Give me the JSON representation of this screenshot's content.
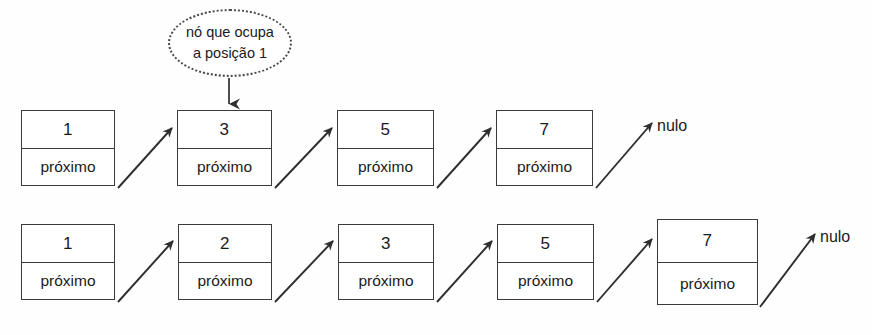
{
  "diagram": {
    "callout": {
      "line1": "nó que ocupa",
      "line2": "a posição 1"
    },
    "null_label": "nulo",
    "link_label": "próximo",
    "rows": [
      {
        "name": "lista-original",
        "nodes": [
          {
            "value": "1",
            "link": "próximo"
          },
          {
            "value": "3",
            "link": "próximo"
          },
          {
            "value": "5",
            "link": "próximo"
          },
          {
            "value": "7",
            "link": "próximo"
          }
        ],
        "terminator": "nulo"
      },
      {
        "name": "lista-apos-insercao",
        "nodes": [
          {
            "value": "1",
            "link": "próximo"
          },
          {
            "value": "2",
            "link": "próximo"
          },
          {
            "value": "3",
            "link": "próximo"
          },
          {
            "value": "5",
            "link": "próximo"
          },
          {
            "value": "7",
            "link": "próximo"
          }
        ],
        "terminator": "nulo"
      }
    ],
    "colors": {
      "stroke": "#3a3a3a",
      "text": "#1a1a1a",
      "background": "#fefefe"
    }
  }
}
